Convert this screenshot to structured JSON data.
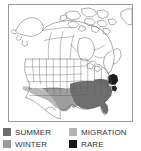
{
  "map": {
    "title": "North America bird range map",
    "region": "North America",
    "frame_color": "#9a9a9a",
    "background_color": "#ffffff",
    "outline_color": "#4a4a4a",
    "areas": [
      {
        "name": "alaska",
        "label": "Alaska"
      },
      {
        "name": "canada",
        "label": "Canada"
      },
      {
        "name": "arctic-islands",
        "label": "Canadian Arctic Archipelago"
      },
      {
        "name": "greenland-edge",
        "label": "Greenland edge"
      },
      {
        "name": "united-states",
        "label": "United States"
      },
      {
        "name": "mexico",
        "label": "Mexico"
      }
    ],
    "range_regions": [
      {
        "name": "migration-southwest",
        "category": "MIGRATION",
        "color": "#b4b4b4"
      },
      {
        "name": "winter-south-central",
        "category": "WINTER",
        "color": "#9a9a9a"
      },
      {
        "name": "summer-southeast",
        "category": "SUMMER",
        "color": "#6e6e6e"
      },
      {
        "name": "rare-northeast-coast",
        "category": "RARE",
        "color": "#1a1a1a"
      }
    ]
  },
  "legend": {
    "rows": [
      {
        "items": [
          {
            "label": "SUMMER",
            "color": "#6e6e6e",
            "swatch_name": "summer-swatch"
          },
          {
            "label": "MIGRATION",
            "color": "#b4b4b4",
            "swatch_name": "migration-swatch"
          }
        ]
      },
      {
        "items": [
          {
            "label": "WINTER",
            "color": "#9a9a9a",
            "swatch_name": "winter-swatch"
          },
          {
            "label": "RARE",
            "color": "#1a1a1a",
            "swatch_name": "rare-swatch"
          }
        ]
      }
    ]
  }
}
